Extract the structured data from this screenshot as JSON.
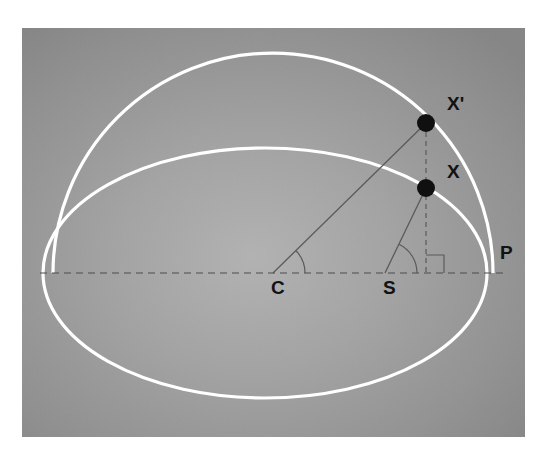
{
  "figure": {
    "background_color": "#ffffff",
    "panel_color": "#8e8e8e",
    "panel_center_color": "#a8a8a8",
    "curve_color": "#ffffff",
    "construction_line_color": "#5a5a5a",
    "marker_color": "#101010",
    "label_color": "#121212"
  },
  "labels": {
    "x_prime": "X'",
    "x": "X",
    "p": "P",
    "c": "C",
    "s": "S"
  },
  "chart_data": {
    "type": "diagram",
    "xlabel": "",
    "ylabel": "",
    "grid": false,
    "legend": "none",
    "xlim": [
      0,
      503
    ],
    "ylim": [
      0,
      409
    ],
    "curves": [
      {
        "name": "auxiliary-circle",
        "kind": "arc",
        "stroke": "#ffffff",
        "stroke_width": 3.2,
        "cx": 251,
        "cy": 245,
        "rx": 220,
        "ry": 220,
        "start_angle_deg": 180,
        "end_angle_deg": 360,
        "note": "upper auxiliary circle arc from left vertex through apex to P"
      },
      {
        "name": "orbit-ellipse",
        "kind": "ellipse",
        "stroke": "#ffffff",
        "stroke_width": 3.2,
        "cx": 243,
        "cy": 245,
        "rx": 222,
        "ry": 125,
        "note": "full elliptical orbit"
      }
    ],
    "lines": [
      {
        "name": "major-axis",
        "kind": "dashed-line",
        "stroke": "#4d4d4d",
        "stroke_width": 1.2,
        "dash": "7 5",
        "x1": 18,
        "y1": 245,
        "x2": 483,
        "y2": 245
      },
      {
        "name": "radius-C-to-Xprime",
        "kind": "line",
        "stroke": "#5a5a5a",
        "stroke_width": 1.3,
        "x1": 251,
        "y1": 245,
        "x2": 404,
        "y2": 95
      },
      {
        "name": "radius-S-to-X",
        "kind": "line",
        "stroke": "#5a5a5a",
        "stroke_width": 1.3,
        "x1": 363,
        "y1": 245,
        "x2": 404,
        "y2": 160
      },
      {
        "name": "ordinate-dashed-Xprime-to-axis",
        "kind": "dashed-line",
        "stroke": "#5a5a5a",
        "stroke_width": 1.2,
        "dash": "5 4",
        "x1": 404,
        "y1": 95,
        "x2": 404,
        "y2": 245
      }
    ],
    "angle_arcs": [
      {
        "name": "eccentric-anomaly-arc-at-C",
        "vertex": [
          251,
          245
        ],
        "radius": 32,
        "start_angle_deg": 0,
        "end_angle_deg": 44,
        "stroke": "#5a5a5a"
      },
      {
        "name": "true-anomaly-arc-at-S",
        "vertex": [
          363,
          245
        ],
        "radius": 32,
        "start_angle_deg": 0,
        "end_angle_deg": 64,
        "stroke": "#5a5a5a"
      }
    ],
    "right_angle_marker": {
      "name": "right-angle-at-ordinate-foot",
      "corner": [
        404,
        245
      ],
      "size": 18,
      "direction": "up-right",
      "stroke": "#5a5a5a"
    },
    "points": [
      {
        "label": "X'",
        "name": "point-x-prime",
        "x": 404,
        "y": 95,
        "marker": "filled-circle",
        "radius": 9,
        "fill": "#101010",
        "label_x": 425,
        "label_y": 82,
        "description": "position on auxiliary circle"
      },
      {
        "label": "X",
        "name": "point-x",
        "x": 404,
        "y": 160,
        "marker": "filled-circle",
        "radius": 9,
        "fill": "#101010",
        "label_x": 425,
        "label_y": 150,
        "description": "orbiting body on ellipse"
      },
      {
        "label": "P",
        "name": "point-p",
        "x": 465,
        "y": 247,
        "marker": "none",
        "label_x": 478,
        "label_y": 231,
        "description": "perihelion"
      },
      {
        "label": "C",
        "name": "point-c",
        "x": 251,
        "y": 245,
        "marker": "none",
        "label_x": 249,
        "label_y": 266,
        "description": "centre of ellipse"
      },
      {
        "label": "S",
        "name": "point-s",
        "x": 363,
        "y": 245,
        "marker": "none",
        "label_x": 361,
        "label_y": 266,
        "description": "Sun at focus"
      }
    ]
  }
}
